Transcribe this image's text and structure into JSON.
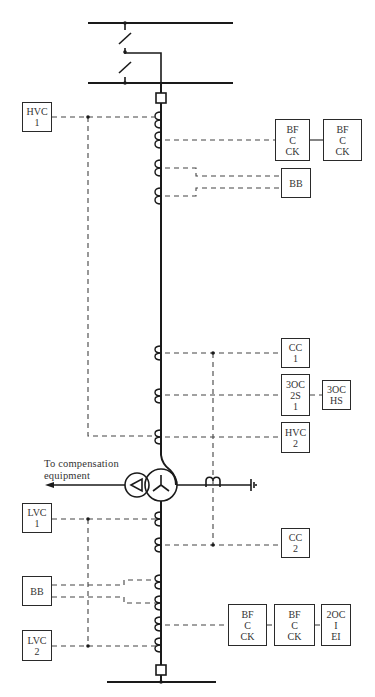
{
  "diagram": {
    "title": "",
    "annotation": {
      "line1": "To compensation",
      "line2": "equipment"
    },
    "boxes": [
      {
        "id": "hvc1",
        "lines": [
          "HVC",
          "1"
        ],
        "x": 22,
        "y": 102,
        "w": 30,
        "h": 30
      },
      {
        "id": "bfcck-top-1",
        "lines": [
          "BF",
          "C",
          "CK"
        ],
        "x": 275,
        "y": 119,
        "w": 35,
        "h": 42
      },
      {
        "id": "bfcck-top-2",
        "lines": [
          "BF",
          "C",
          "CK"
        ],
        "x": 323,
        "y": 119,
        "w": 39,
        "h": 42
      },
      {
        "id": "bb-top",
        "lines": [
          "BB"
        ],
        "x": 281,
        "y": 168,
        "w": 30,
        "h": 30
      },
      {
        "id": "cc1",
        "lines": [
          "CC",
          "1"
        ],
        "x": 281,
        "y": 338,
        "w": 29,
        "h": 30
      },
      {
        "id": "3oc-2s-1",
        "lines": [
          "3OC",
          "2S",
          "1"
        ],
        "x": 281,
        "y": 374,
        "w": 29,
        "h": 42
      },
      {
        "id": "3oc-hs",
        "lines": [
          "3OC",
          "HS"
        ],
        "x": 322,
        "y": 380,
        "w": 29,
        "h": 30
      },
      {
        "id": "hvc2",
        "lines": [
          "HVC",
          "2"
        ],
        "x": 281,
        "y": 422,
        "w": 29,
        "h": 31
      },
      {
        "id": "lvc1",
        "lines": [
          "LVC",
          "1"
        ],
        "x": 22,
        "y": 503,
        "w": 30,
        "h": 30
      },
      {
        "id": "cc2",
        "lines": [
          "CC",
          "2"
        ],
        "x": 281,
        "y": 528,
        "w": 29,
        "h": 30
      },
      {
        "id": "bb-bottom",
        "lines": [
          "BB"
        ],
        "x": 22,
        "y": 576,
        "w": 30,
        "h": 30
      },
      {
        "id": "bfcck-bot-1",
        "lines": [
          "BF",
          "C",
          "CK"
        ],
        "x": 228,
        "y": 604,
        "w": 39,
        "h": 42
      },
      {
        "id": "bfcck-bot-2",
        "lines": [
          "BF",
          "C",
          "CK"
        ],
        "x": 274,
        "y": 604,
        "w": 41,
        "h": 42
      },
      {
        "id": "2oc-i-ei",
        "lines": [
          "2OC",
          "I",
          "EI"
        ],
        "x": 321,
        "y": 604,
        "w": 30,
        "h": 42
      },
      {
        "id": "lvc2",
        "lines": [
          "LVC",
          "2"
        ],
        "x": 22,
        "y": 630,
        "w": 30,
        "h": 31
      }
    ],
    "colors": {
      "line": "#1a1a1a",
      "dashed": "#444444",
      "text": "#333333",
      "background": "#ffffff"
    }
  }
}
